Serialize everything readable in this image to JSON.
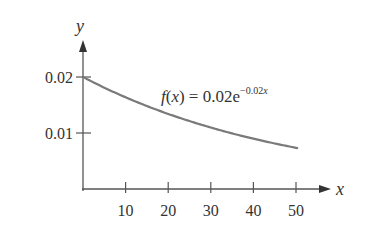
{
  "chart_data": {
    "type": "line",
    "title": "",
    "xlabel": "x",
    "ylabel": "y",
    "x_ticks": [
      10,
      20,
      30,
      40,
      50
    ],
    "x_tick_labels": [
      "10",
      "20",
      "30",
      "40",
      "50"
    ],
    "y_ticks": [
      0.01,
      0.02
    ],
    "y_tick_labels": [
      "0.01",
      "0.02"
    ],
    "xlim": [
      0,
      55
    ],
    "ylim": [
      0,
      0.025
    ],
    "grid": false,
    "legend": null,
    "annotation": {
      "text_prefix": "f(x) = 0.02e",
      "text_exponent": "−0.02x",
      "full": "f(x) = 0.02e^(−0.02x)"
    },
    "series": [
      {
        "name": "f(x) = 0.02e^(-0.02x)",
        "function": "0.02*exp(-0.02*x)",
        "x": [
          0,
          5,
          10,
          15,
          20,
          25,
          30,
          35,
          40,
          45,
          50
        ],
        "values": [
          0.02,
          0.0181,
          0.0164,
          0.0148,
          0.0134,
          0.0121,
          0.011,
          0.0099,
          0.009,
          0.0081,
          0.0074
        ]
      }
    ],
    "colors": {
      "curve": "#7a7a7a",
      "axes": "#555555",
      "text": "#333333"
    }
  }
}
